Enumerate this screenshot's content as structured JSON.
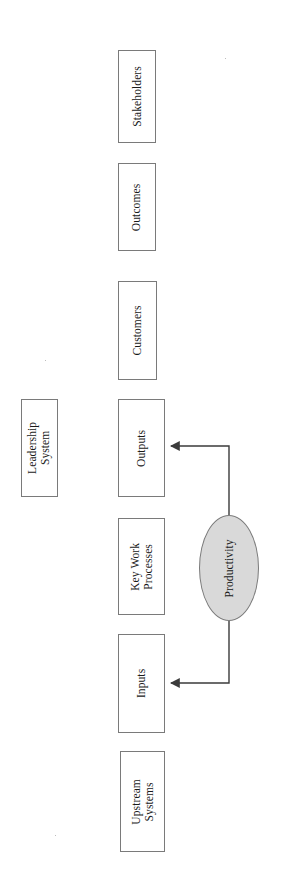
{
  "document": {
    "type": "process-flow-diagram",
    "orientation": "rotated-90-counterclockwise",
    "background_color": "#ffffff"
  },
  "palette": {
    "box_stroke": "#7a7a7a",
    "box_fill": "#ffffff",
    "ellipse_fill": "#d9d9d9",
    "ellipse_stroke": "#7a7a7a",
    "connector": "#3b3b3b",
    "text": "#1a1a1a"
  },
  "nodes": [
    {
      "id": "stakeholders",
      "label": "Stakeholders",
      "shape": "rectangle",
      "x": 118,
      "y": 50,
      "w": 38,
      "h": 93
    },
    {
      "id": "outcomes",
      "label": "Outcomes",
      "shape": "rectangle",
      "x": 118,
      "y": 163,
      "w": 38,
      "h": 88
    },
    {
      "id": "customers",
      "label": "Customers",
      "shape": "rectangle",
      "x": 118,
      "y": 281,
      "w": 39,
      "h": 99
    },
    {
      "id": "leadership-system",
      "label": "Leadership\nSystem",
      "shape": "rectangle",
      "x": 21,
      "y": 399,
      "w": 37,
      "h": 98
    },
    {
      "id": "outputs",
      "label": "Outputs",
      "shape": "rectangle",
      "x": 118,
      "y": 399,
      "w": 47,
      "h": 98
    },
    {
      "id": "key-work-processes",
      "label": "Key Work\nProcesses",
      "shape": "rectangle",
      "x": 118,
      "y": 518,
      "w": 47,
      "h": 97
    },
    {
      "id": "productivity",
      "label": "Productivity",
      "shape": "ellipse",
      "x": 199,
      "y": 515,
      "w": 60,
      "h": 106
    },
    {
      "id": "inputs",
      "label": "Inputs",
      "shape": "rectangle",
      "x": 118,
      "y": 634,
      "w": 47,
      "h": 99
    },
    {
      "id": "upstream-systems",
      "label": "Upstream\nSystems",
      "shape": "rectangle",
      "x": 120,
      "y": 751,
      "w": 45,
      "h": 101
    }
  ],
  "connectors": [
    {
      "id": "productivity-to-outputs",
      "from": "productivity",
      "to": "outputs",
      "arrowhead": "to",
      "path": "M 229 515 L 229 446 L 169 446"
    },
    {
      "id": "productivity-to-inputs",
      "from": "productivity",
      "to": "inputs",
      "arrowhead": "to",
      "path": "M 229 621 L 229 683 L 169 683"
    }
  ]
}
